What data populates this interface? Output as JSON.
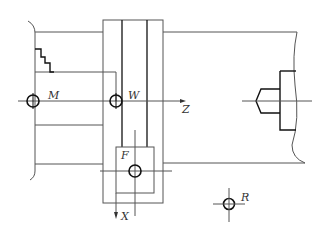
{
  "diagram": {
    "type": "engineering-line-drawing",
    "colors": {
      "line": "#555555",
      "bold": "#111111",
      "background": "#ffffff"
    },
    "labels": {
      "machine_origin": "M",
      "workpiece_origin": "W",
      "z_axis": "Z",
      "x_axis": "X",
      "tool_reference": "F",
      "reference_point": "R"
    },
    "components": [
      {
        "id": "chuck",
        "description": "Spindle chuck (left)"
      },
      {
        "id": "workpiece",
        "description": "Stepped workpiece"
      },
      {
        "id": "carriage",
        "description": "Carriage / cross slide"
      },
      {
        "id": "tool-holder",
        "description": "Tool holder with reference point F"
      },
      {
        "id": "tailstock",
        "description": "Tailstock with center (right)"
      }
    ],
    "markers": [
      {
        "label": "M",
        "x": 33,
        "y": 101
      },
      {
        "label": "W",
        "x": 116,
        "y": 101
      },
      {
        "label": "F",
        "x": 135,
        "y": 171
      },
      {
        "label": "R",
        "x": 229,
        "y": 204
      }
    ]
  }
}
